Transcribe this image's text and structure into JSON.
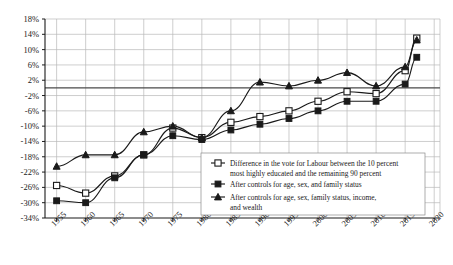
{
  "chart_data": {
    "type": "line",
    "title": "",
    "xlabel": "",
    "ylabel": "",
    "grid": true,
    "legend_position": "inside-bottom-right",
    "x": [
      1955,
      1960,
      1965,
      1970,
      1975,
      1980,
      1985,
      1990,
      1995,
      2000,
      2005,
      2010,
      2015,
      2017
    ],
    "xlim": [
      1953,
      2021
    ],
    "xticks": [
      "1955",
      "1960",
      "1965",
      "1970",
      "1975",
      "1980",
      "1985",
      "1990",
      "1995",
      "2000",
      "2005",
      "2010",
      "2015",
      "2020"
    ],
    "xtick_values": [
      1955,
      1960,
      1965,
      1970,
      1975,
      1980,
      1985,
      1990,
      1995,
      2000,
      2005,
      2010,
      2015,
      2020
    ],
    "ylim": [
      -34,
      18
    ],
    "yticks": [
      "18%",
      "14%",
      "10%",
      "6%",
      "2%",
      "-2%",
      "-6%",
      "-10%",
      "-14%",
      "-18%",
      "-22%",
      "-26%",
      "-30%",
      "-34%"
    ],
    "ytick_values": [
      18,
      14,
      10,
      6,
      2,
      -2,
      -6,
      -10,
      -14,
      -18,
      -22,
      -26,
      -30,
      -34
    ],
    "series": [
      {
        "name": "Difference in the vote for Labour between the 10 percent most highly educated and the remaining 90 percent",
        "marker": "open-square",
        "values": [
          -25.5,
          -27.5,
          -23.0,
          -17.5,
          -10.5,
          -13.0,
          -9.0,
          -7.5,
          -6.0,
          -3.5,
          -1.0,
          -1.5,
          4.5,
          13.0
        ]
      },
      {
        "name": "After controls for age, sex, and family status",
        "marker": "filled-square",
        "values": [
          -29.5,
          -30.0,
          -23.5,
          -17.5,
          -12.5,
          -13.5,
          -11.0,
          -9.5,
          -8.0,
          -6.0,
          -3.5,
          -3.5,
          1.0,
          8.0
        ]
      },
      {
        "name": "After controls for age, sex, family status, income, and wealth",
        "marker": "filled-triangle",
        "values": [
          -20.5,
          -17.5,
          -17.5,
          -11.5,
          -10.0,
          -13.0,
          -6.0,
          1.5,
          0.5,
          2.0,
          4.0,
          0.5,
          5.5,
          12.5
        ]
      }
    ]
  },
  "legend": {
    "entries": [
      {
        "marker": "open-square",
        "line1": "Difference in the vote for Labour between the 10 percent",
        "line2": "most highly educated and the remaining 90 percent"
      },
      {
        "marker": "filled-square",
        "line1": "After controls for age, sex, and family status",
        "line2": ""
      },
      {
        "marker": "filled-triangle",
        "line1": "After controls for age, sex, family status, income,",
        "line2": "and wealth"
      }
    ]
  },
  "colors": {
    "ink": "#1a1a1a",
    "grid": "#b9b9b9",
    "background": "#ffffff"
  }
}
